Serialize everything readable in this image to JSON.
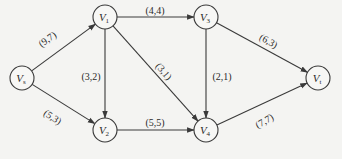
{
  "diagram": {
    "type": "network-flow-graph",
    "nodes": [
      {
        "id": "s",
        "label": "V",
        "sub": "s",
        "x": 22,
        "y": 78
      },
      {
        "id": "1",
        "label": "V",
        "sub": "1",
        "x": 105,
        "y": 17
      },
      {
        "id": "2",
        "label": "V",
        "sub": "2",
        "x": 105,
        "y": 130
      },
      {
        "id": "3",
        "label": "V",
        "sub": "3",
        "x": 206,
        "y": 17
      },
      {
        "id": "4",
        "label": "V",
        "sub": "4",
        "x": 206,
        "y": 130
      },
      {
        "id": "t",
        "label": "V",
        "sub": "t",
        "x": 318,
        "y": 78
      }
    ],
    "edges": [
      {
        "from": "s",
        "to": "1",
        "label": "(9,7)",
        "lx": 48,
        "ly": 40,
        "rot": -36
      },
      {
        "from": "s",
        "to": "2",
        "label": "(5,3)",
        "lx": 52,
        "ly": 118,
        "rot": 33
      },
      {
        "from": "1",
        "to": "3",
        "label": "(4,4)",
        "lx": 155,
        "ly": 12,
        "rot": 0
      },
      {
        "from": "1",
        "to": "2",
        "label": "(3,2)",
        "lx": 91,
        "ly": 78,
        "rot": 0
      },
      {
        "from": "1",
        "to": "4",
        "label": "(3,1)",
        "lx": 163,
        "ly": 72,
        "rot": 50
      },
      {
        "from": "2",
        "to": "4",
        "label": "(5,5)",
        "lx": 155,
        "ly": 124,
        "rot": 0
      },
      {
        "from": "3",
        "to": "4",
        "label": "(2,1)",
        "lx": 222,
        "ly": 78,
        "rot": 0
      },
      {
        "from": "3",
        "to": "t",
        "label": "(6,3)",
        "lx": 268,
        "ly": 42,
        "rot": 30
      },
      {
        "from": "4",
        "to": "t",
        "label": "(7,7)",
        "lx": 265,
        "ly": 122,
        "rot": -30
      }
    ],
    "colors": {
      "line": "#3a3a3a",
      "background": "#f4f4f2",
      "text": "#2a2a2a"
    }
  }
}
